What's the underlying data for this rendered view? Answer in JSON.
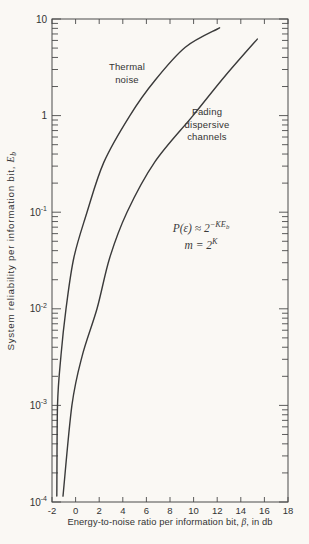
{
  "colors": {
    "paper": "#faf8f4",
    "ink": "#333333",
    "curve": "#3a3a3a",
    "frame": "#4a4a4a"
  },
  "chart_data": {
    "type": "line",
    "title": "",
    "xlabel": "Energy-to-noise ratio per information bit, β, in db",
    "ylabel": "System reliability per information bit, Eb",
    "grid": false,
    "legend_position": "inline-curve-labels",
    "x_axis": {
      "min": -2,
      "max": 18,
      "tick_step": 2,
      "tick_labels": [
        "-2",
        "0",
        "2",
        "4",
        "6",
        "8",
        "10",
        "12",
        "14",
        "16",
        "18"
      ]
    },
    "y_axis": {
      "scale": "log",
      "top_exp": 1,
      "bottom_exp": -4,
      "tick_labels": [
        {
          "base": "10",
          "sup": ""
        },
        {
          "base": "1",
          "sup": ""
        },
        {
          "base": "10",
          "sup": "-1"
        },
        {
          "base": "10",
          "sup": "-2"
        },
        {
          "base": "10",
          "sup": "-3"
        },
        {
          "base": "10",
          "sup": "-4"
        }
      ]
    },
    "series": [
      {
        "name": "Thermal noise",
        "label_lines": [
          "Thermal",
          "noise"
        ],
        "points": [
          [
            -1.59,
            0.000115
          ],
          [
            -1.53,
            0.001
          ],
          [
            -1.24,
            0.0033
          ],
          [
            -0.81,
            0.01
          ],
          [
            -0.14,
            0.034
          ],
          [
            0.97,
            0.1
          ],
          [
            2.4,
            0.33
          ],
          [
            4.6,
            1.0
          ],
          [
            6.7,
            2.3
          ],
          [
            9.3,
            5.1
          ],
          [
            12.2,
            8.1
          ]
        ]
      },
      {
        "name": "Fading dispersive channels",
        "label_lines": [
          "Fading",
          "dispersive",
          "channels"
        ],
        "points": [
          [
            -1.07,
            0.000115
          ],
          [
            -0.31,
            0.001
          ],
          [
            0.54,
            0.0032
          ],
          [
            1.81,
            0.01
          ],
          [
            2.9,
            0.034
          ],
          [
            4.36,
            0.1
          ],
          [
            6.7,
            0.33
          ],
          [
            9.95,
            1.0
          ],
          [
            12.7,
            2.6
          ],
          [
            15.4,
            6.2
          ]
        ]
      }
    ],
    "annotation": {
      "line1_base": "P(ε) ≈ 2",
      "line1_exp": "−KE",
      "line1_exp_sub": "b",
      "line2_base": "m = 2",
      "line2_exp": "K"
    },
    "axis_titles": {
      "x_main": "Energy-to-noise ratio per information bit, ",
      "x_symbol": "β",
      "x_suffix": ", in db",
      "y_main": "System reliability per information bit, ",
      "y_symbol": "E",
      "y_symbol_sub": "b"
    }
  }
}
